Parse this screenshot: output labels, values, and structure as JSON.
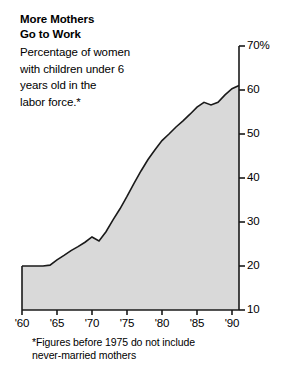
{
  "headline": {
    "line1": "More Mothers",
    "line2": "Go to Work"
  },
  "deck": {
    "line1": "Percentage of women",
    "line2": "with children under 6",
    "line3": "years old in the",
    "line4": "labor force.*"
  },
  "footnote": {
    "line1": "*Figures before 1975 do not include",
    "line2": "never-married mothers"
  },
  "colors": {
    "area_fill": "#d9d9d9",
    "line": "#1a1a1a",
    "axis": "#1a1a1a",
    "text": "#000000",
    "background": "#ffffff"
  },
  "chart_data": {
    "type": "area",
    "title": "More Mothers Go to Work",
    "subtitle": "Percentage of women with children under 6 years old in the labor force.*",
    "xlabel": "",
    "ylabel": "",
    "xlim": [
      1960,
      1991
    ],
    "ylim": [
      10,
      70
    ],
    "grid": false,
    "legend": false,
    "y_unit": "%",
    "y_ticks": [
      {
        "value": 70,
        "label": "70%"
      },
      {
        "value": 60,
        "label": "60"
      },
      {
        "value": 50,
        "label": "50"
      },
      {
        "value": 40,
        "label": "40"
      },
      {
        "value": 30,
        "label": "30"
      },
      {
        "value": 20,
        "label": "20"
      },
      {
        "value": 10,
        "label": "10"
      }
    ],
    "x_ticks": [
      {
        "value": 1960,
        "label": "'60"
      },
      {
        "value": 1965,
        "label": "'65"
      },
      {
        "value": 1970,
        "label": "'70"
      },
      {
        "value": 1975,
        "label": "'75"
      },
      {
        "value": 1980,
        "label": "'80"
      },
      {
        "value": 1985,
        "label": "'85"
      },
      {
        "value": 1990,
        "label": "'90"
      }
    ],
    "x": [
      1960,
      1961,
      1962,
      1963,
      1964,
      1965,
      1966,
      1967,
      1968,
      1969,
      1970,
      1971,
      1972,
      1973,
      1974,
      1975,
      1976,
      1977,
      1978,
      1979,
      1980,
      1981,
      1982,
      1983,
      1984,
      1985,
      1986,
      1987,
      1988,
      1989,
      1990,
      1991
    ],
    "values": [
      20.0,
      20.0,
      20.0,
      20.0,
      20.2,
      21.4,
      22.4,
      23.5,
      24.4,
      25.4,
      26.6,
      25.7,
      27.8,
      30.5,
      33.0,
      35.8,
      38.8,
      41.6,
      44.2,
      46.4,
      48.5,
      50.0,
      51.6,
      53.0,
      54.5,
      56.1,
      57.2,
      56.6,
      57.2,
      58.9,
      60.3,
      61.0
    ],
    "series": [
      {
        "name": "Percentage of women with children under 6 in the labor force",
        "values": [
          20.0,
          20.0,
          20.0,
          20.0,
          20.2,
          21.4,
          22.4,
          23.5,
          24.4,
          25.4,
          26.6,
          25.7,
          27.8,
          30.5,
          33.0,
          35.8,
          38.8,
          41.6,
          44.2,
          46.4,
          48.5,
          50.0,
          51.6,
          53.0,
          54.5,
          56.1,
          57.2,
          56.6,
          57.2,
          58.9,
          60.3,
          61.0
        ]
      }
    ],
    "annotations": [
      {
        "text": "*Figures before 1975 do not include never-married mothers",
        "position": "below-axis"
      }
    ]
  }
}
